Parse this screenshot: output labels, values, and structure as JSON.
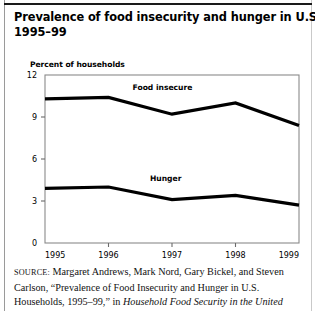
{
  "title": {
    "line1": "Prevalence of food insecurity and hunger in U.S. households,",
    "line2": "1995–99"
  },
  "subtitle": "Percent of households",
  "chart_data": {
    "type": "line",
    "title": "Prevalence of food insecurity and hunger in U.S. households, 1995–99",
    "xlabel": "",
    "ylabel": "Percent of households",
    "categories": [
      "1995",
      "1996",
      "1997",
      "1998",
      "1999"
    ],
    "x": [
      1995,
      1996,
      1997,
      1998,
      1999
    ],
    "ylim": [
      0,
      12
    ],
    "yticks": [
      0,
      3,
      6,
      9,
      12
    ],
    "ytick_labels": [
      "0",
      "3",
      "6",
      "9",
      "12"
    ],
    "grid": false,
    "legend": "inline-labels",
    "series": [
      {
        "name": "Food insecure",
        "values": [
          10.3,
          10.4,
          9.2,
          10.0,
          8.4
        ],
        "color": "#000000",
        "label_x": 1996.85,
        "label_y": 10.95
      },
      {
        "name": "Hunger",
        "values": [
          3.9,
          4.0,
          3.1,
          3.4,
          2.7
        ],
        "color": "#000000",
        "label_x": 1996.9,
        "label_y": 4.45
      }
    ],
    "annotations": [
      {
        "text": "Food insecure",
        "series": "Food insecure"
      },
      {
        "text": "Hunger",
        "series": "Hunger"
      }
    ]
  },
  "source": {
    "label": "SOURCE:",
    "line1_rest": " Margaret Andrews, Mark Nord, Gary Bickel, and Steven",
    "line2": "Carlson, “Prevalence of Food Insecurity and Hunger in U.S.",
    "line3_plain": "Households, 1995–99,” in ",
    "line3_italic": "Household Food Security in the United"
  },
  "colors": {
    "line": "#000000",
    "axis": "#6b6b6b",
    "frame": "#8a8a8a",
    "page_rule": "#9a9a9a",
    "text": "#000000"
  }
}
